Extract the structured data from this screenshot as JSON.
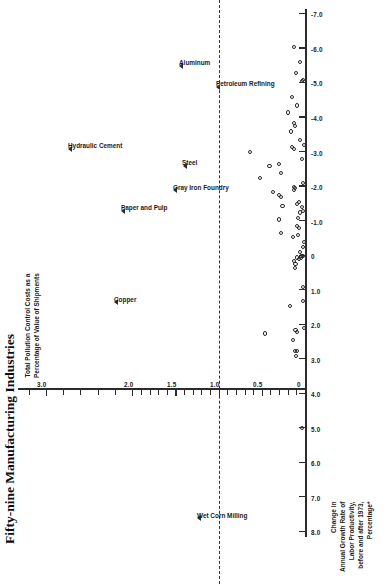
{
  "chart_data": {
    "type": "scatter",
    "title": "Fifty-nine Manufacturing Industries",
    "xlabel": "Change in\nAnnual Growth Rate of\nLabor Productivity,\nbefore and after 1973,\nPercentage*",
    "xlabel_lines": [
      "Change in",
      "Annual Growth Rate of",
      "Labor Productivity,",
      "before and after 1973,",
      "Percentage*"
    ],
    "ylabel": "Total Pollution Control Costs as a\nPercentage of Value of Shipments",
    "ylabel_lines": [
      "Total Pollution Control Costs as a",
      "Percentage of Value of Shipments"
    ],
    "xlim": [
      8.0,
      -7.0
    ],
    "ylim": [
      0,
      3.3
    ],
    "x_ticks": [
      "8.0",
      "7.0",
      "6.0",
      "5.0",
      "4.0",
      "3.0",
      "2.0",
      "1.0",
      "0",
      "-1.0",
      "-2.0",
      "-3.0",
      "-4.0",
      "-5.0",
      "-6.0",
      "-7.0"
    ],
    "x_tick_values": [
      8.0,
      7.0,
      6.0,
      5.0,
      4.0,
      3.0,
      2.0,
      1.0,
      0,
      -1.0,
      -2.0,
      -3.0,
      -4.0,
      -5.0,
      -6.0,
      -7.0
    ],
    "y_ticks_major": [
      "0",
      "0.5",
      "1.0",
      "1.5",
      "2.0",
      "3.0"
    ],
    "y_tick_major_values": [
      0,
      0.5,
      1.0,
      1.5,
      2.0,
      3.0
    ],
    "y_tick_minor_values": [
      0.1,
      0.2,
      0.3,
      0.4,
      0.6,
      0.7,
      0.8,
      0.9,
      1.1,
      1.2,
      1.3,
      1.4,
      1.6,
      1.7,
      1.8,
      1.9,
      2.2,
      2.4,
      2.6,
      2.8,
      3.2
    ],
    "reference_line": {
      "axis": "y",
      "value": 1.0,
      "style": "dashed"
    },
    "grid": false,
    "legend": null,
    "marker_unlabeled": "open-circle",
    "marker_labeled": "open-triangle",
    "labeled_points": [
      {
        "label": "Wet Corn Milling",
        "x": 7.6,
        "y": 1.22
      },
      {
        "label": "Copper",
        "x": 1.35,
        "y": 2.18
      },
      {
        "label": "Paper and Pulp",
        "x": -1.3,
        "y": 2.1
      },
      {
        "label": "Hydraulic Cement",
        "x": -3.1,
        "y": 2.72
      },
      {
        "label": "Gray Iron Foundry",
        "x": -1.9,
        "y": 1.5
      },
      {
        "label": "Steel",
        "x": -2.6,
        "y": 1.39
      },
      {
        "label": "Aluminum",
        "x": -5.5,
        "y": 1.43
      },
      {
        "label": "Petroleum Refining",
        "x": -4.9,
        "y": 1.0
      }
    ],
    "points": [
      {
        "x": 5.0,
        "y": 0.03
      },
      {
        "x": 2.9,
        "y": 0.1
      },
      {
        "x": 2.75,
        "y": 0.09
      },
      {
        "x": 2.75,
        "y": 0.12
      },
      {
        "x": 2.45,
        "y": 0.14
      },
      {
        "x": 2.25,
        "y": 0.46
      },
      {
        "x": 2.2,
        "y": 0.09
      },
      {
        "x": 2.15,
        "y": 0.11
      },
      {
        "x": 2.1,
        "y": 0.01
      },
      {
        "x": 1.45,
        "y": 0.17
      },
      {
        "x": 1.3,
        "y": 0.02
      },
      {
        "x": 0.9,
        "y": 0.02
      },
      {
        "x": 0.35,
        "y": 0.12
      },
      {
        "x": 0.25,
        "y": 0.11
      },
      {
        "x": 0.15,
        "y": 0.13
      },
      {
        "x": 0.1,
        "y": 0.07
      },
      {
        "x": 0.05,
        "y": 0.05
      },
      {
        "x": 0.05,
        "y": 0.09
      },
      {
        "x": 0.0,
        "y": 0.04
      },
      {
        "x": 0.0,
        "y": 0.02
      },
      {
        "x": -0.1,
        "y": 0.06
      },
      {
        "x": -0.25,
        "y": 0.02
      },
      {
        "x": -0.4,
        "y": 0.01
      },
      {
        "x": -0.55,
        "y": 0.14
      },
      {
        "x": -0.6,
        "y": 0.08
      },
      {
        "x": -0.65,
        "y": 0.28
      },
      {
        "x": -0.8,
        "y": 0.07
      },
      {
        "x": -0.85,
        "y": 0.09
      },
      {
        "x": -1.05,
        "y": 0.3
      },
      {
        "x": -1.1,
        "y": 0.08
      },
      {
        "x": -1.25,
        "y": 0.06
      },
      {
        "x": -1.3,
        "y": 0.02
      },
      {
        "x": -1.4,
        "y": 0.03
      },
      {
        "x": -1.45,
        "y": 0.26
      },
      {
        "x": -1.5,
        "y": 0.09
      },
      {
        "x": -1.55,
        "y": 0.07
      },
      {
        "x": -1.7,
        "y": 0.28
      },
      {
        "x": -1.75,
        "y": 0.3
      },
      {
        "x": -1.85,
        "y": 0.37
      },
      {
        "x": -1.9,
        "y": 0.13
      },
      {
        "x": -1.95,
        "y": 0.12
      },
      {
        "x": -2.0,
        "y": 0.125
      },
      {
        "x": -2.1,
        "y": 0.02
      },
      {
        "x": -2.25,
        "y": 0.52
      },
      {
        "x": -2.4,
        "y": 0.28
      },
      {
        "x": -2.6,
        "y": 0.41
      },
      {
        "x": -2.65,
        "y": 0.3
      },
      {
        "x": -2.8,
        "y": 0.03
      },
      {
        "x": -3.0,
        "y": 0.64
      },
      {
        "x": -3.1,
        "y": 0.13
      },
      {
        "x": -3.15,
        "y": 0.15
      },
      {
        "x": -3.2,
        "y": 0.01
      },
      {
        "x": -3.35,
        "y": 0.06
      },
      {
        "x": -3.6,
        "y": 0.16
      },
      {
        "x": -3.75,
        "y": 0.12
      },
      {
        "x": -3.85,
        "y": 0.125
      },
      {
        "x": -4.15,
        "y": 0.2
      },
      {
        "x": -4.35,
        "y": 0.09
      },
      {
        "x": -4.6,
        "y": 0.15
      },
      {
        "x": -5.05,
        "y": 0.03
      },
      {
        "x": -5.1,
        "y": 0.02
      },
      {
        "x": -5.3,
        "y": 0.1
      },
      {
        "x": -5.6,
        "y": 0.06
      },
      {
        "x": -6.05,
        "y": 0.13
      }
    ]
  }
}
